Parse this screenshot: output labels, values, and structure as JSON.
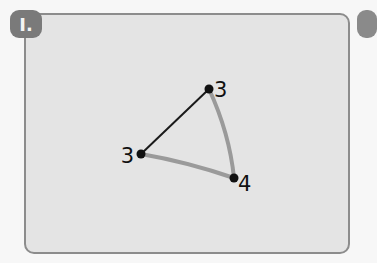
{
  "badge": {
    "label": "I."
  },
  "diagram": {
    "nodes": [
      {
        "id": "top",
        "label": "3"
      },
      {
        "id": "left",
        "label": "3"
      },
      {
        "id": "bottom-right",
        "label": "4"
      }
    ],
    "edges": [
      {
        "from": "top",
        "to": "left",
        "style": "solid-black"
      },
      {
        "from": "top",
        "to": "bottom-right",
        "style": "gray-highlighted"
      },
      {
        "from": "left",
        "to": "bottom-right",
        "style": "gray-highlighted"
      }
    ],
    "colors": {
      "edge_dark": "#1a1a1a",
      "edge_highlight": "#9a9a9a",
      "node": "#111111",
      "card_bg": "#e4e4e4",
      "card_border": "#8c8c8c",
      "badge_bg": "#7a7a7a"
    }
  }
}
